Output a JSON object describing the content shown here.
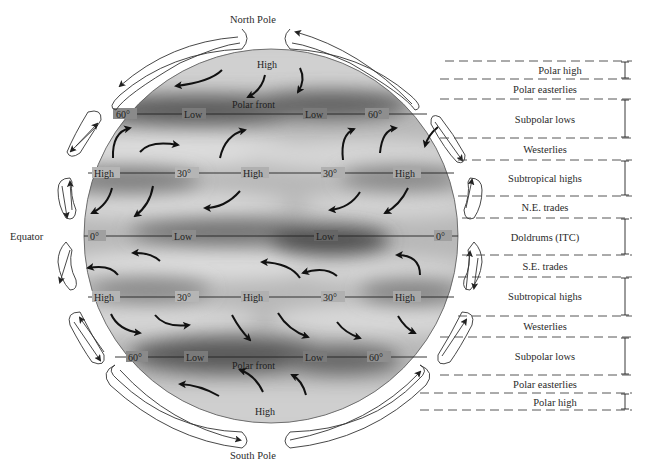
{
  "diagram": {
    "poles": {
      "north": "North Pole",
      "south": "South Pole"
    },
    "equator_label": "Equator",
    "globe_labels": {
      "top_high": "High",
      "bottom_high": "High",
      "polar_front_north": "Polar front",
      "polar_front_south": "Polar front",
      "lat_60n": {
        "left": "60°",
        "mid1": "Low",
        "mid2": "Low",
        "right": "60°"
      },
      "lat_30n": {
        "left": "High",
        "mid1": "30°",
        "mid2": "High",
        "mid3": "30°",
        "right": "High"
      },
      "lat_0": {
        "left": "0°",
        "mid1": "Low",
        "mid2": "Low",
        "right": "0°"
      },
      "lat_30s": {
        "left": "High",
        "mid1": "30°",
        "mid2": "High",
        "mid3": "30°",
        "right": "High"
      },
      "lat_60s": {
        "left": "60°",
        "mid1": "Low",
        "mid2": "Low",
        "right": "60°"
      }
    },
    "zones": [
      {
        "label": "Polar high",
        "y": 70,
        "bracket": true
      },
      {
        "label": "Polar easterlies",
        "y": 89,
        "bracket": false
      },
      {
        "label": "Subpolar lows",
        "y": 119,
        "bracket": true
      },
      {
        "label": "Westerlies",
        "y": 149,
        "bracket": false
      },
      {
        "label": "Subtropical highs",
        "y": 178,
        "bracket": true
      },
      {
        "label": "N.E. trades",
        "y": 207,
        "bracket": false
      },
      {
        "label": "Doldrums (ITC)",
        "y": 237,
        "bracket": true
      },
      {
        "label": "S.E. trades",
        "y": 266,
        "bracket": false
      },
      {
        "label": "Subtropical highs",
        "y": 296,
        "bracket": true
      },
      {
        "label": "Westerlies",
        "y": 326,
        "bracket": false
      },
      {
        "label": "Subpolar lows",
        "y": 356,
        "bracket": true
      },
      {
        "label": "Polar easterlies",
        "y": 384,
        "bracket": false
      },
      {
        "label": "Polar high",
        "y": 402,
        "bracket": true
      }
    ]
  }
}
